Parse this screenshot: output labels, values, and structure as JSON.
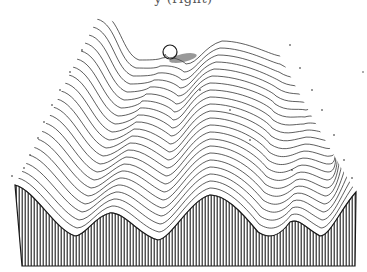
{
  "caption_fragment": "y (right)",
  "illustration": {
    "subject": "stippled energy landscape with a ball resting in a saddle",
    "ball": {
      "cx": 170,
      "cy": 52,
      "r": 7
    },
    "ink_color": "#1a1a1a",
    "background": "#ffffff"
  }
}
